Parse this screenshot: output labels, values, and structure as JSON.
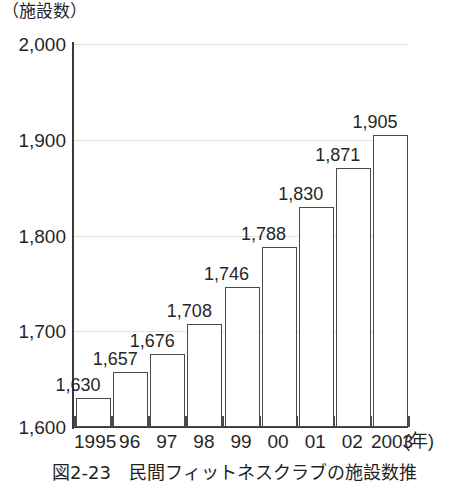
{
  "unit_label": "（施設数）",
  "x_axis_unit": "(年)",
  "figure_caption": "図2-23　民間フィットネスクラブの施設数推",
  "chart_data": {
    "type": "bar",
    "title": "図2-23　民間フィットネスクラブの施設数推",
    "xlabel": "(年)",
    "ylabel": "（施設数）",
    "ylim": [
      1600,
      2000
    ],
    "ytick_step": 100,
    "ytick_labels": [
      "2,000",
      "1,900",
      "1,800",
      "1,700",
      "1,600"
    ],
    "ytick_values": [
      2000,
      1900,
      1800,
      1700,
      1600
    ],
    "grid": true,
    "legend": "none",
    "categories": [
      "1995",
      "96",
      "97",
      "98",
      "99",
      "00",
      "01",
      "02",
      "2003"
    ],
    "values": [
      1630,
      1657,
      1676,
      1708,
      1746,
      1788,
      1830,
      1871,
      1905
    ],
    "value_labels": [
      "1,630",
      "1,657",
      "1,676",
      "1,708",
      "1,746",
      "1,788",
      "1,830",
      "1,871",
      "1,905"
    ],
    "bar_fill": "#ffffff",
    "bar_edge": "#4a4a4a",
    "axis_color": "#3a3a3a",
    "grid_color": "#e2e2e2",
    "background": "#ffffff"
  }
}
